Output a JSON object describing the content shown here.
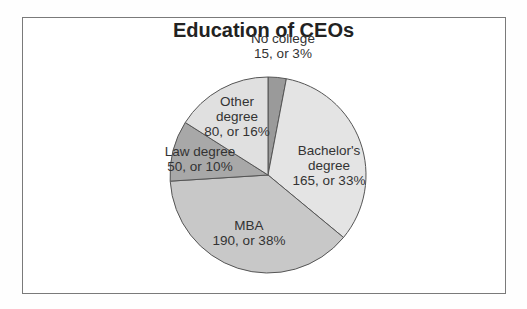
{
  "chart_data": {
    "type": "pie",
    "title": "Education of CEOs",
    "categories": [
      "No college",
      "Bachelor's degree",
      "MBA",
      "Law degree",
      "Other degree"
    ],
    "values": [
      15,
      165,
      190,
      50,
      80
    ],
    "percents": [
      3,
      33,
      38,
      10,
      16
    ],
    "start_angle_deg": 0,
    "direction": "clockwise",
    "colors": [
      "#9a9a9a",
      "#e4e4e4",
      "#c8c8c8",
      "#a8a8a8",
      "#e0e0e0"
    ],
    "legend": "none",
    "slice_labels": [
      {
        "line1": "No college",
        "line2": "15, or 3%"
      },
      {
        "line1": "Bachelor's",
        "line2": "degree",
        "line3": "165, or 33%"
      },
      {
        "line1": "MBA",
        "line2": "190, or 38%"
      },
      {
        "line1": "Law degree",
        "line2": "50, or 10%"
      },
      {
        "line1": "Other",
        "line2": "degree",
        "line3": "80, or 16%"
      }
    ]
  }
}
